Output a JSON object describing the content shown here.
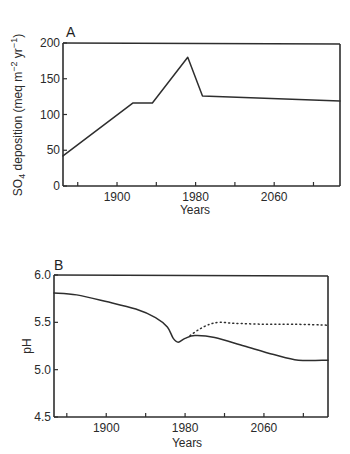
{
  "chart_data": [
    {
      "panel": "A",
      "type": "line",
      "title": "",
      "xlabel": "Years",
      "ylabel": "SO4 deposition (meq m-2 yr-1)",
      "ylabel_parts": {
        "main": "SO",
        "sub": "4",
        "rest": " deposition (meq m",
        "sup1": "−2",
        "mid": " yr",
        "sup2": "−1",
        "end": ")"
      },
      "xlim": [
        1845,
        2127
      ],
      "ylim": [
        0,
        200
      ],
      "x_tick_labels": [
        "1900",
        "1980",
        "2060"
      ],
      "x_ticks": [
        1860,
        1900,
        1940,
        1980,
        2020,
        2060,
        2100
      ],
      "y_tick_labels": [
        "0",
        "50",
        "100",
        "150",
        "200"
      ],
      "y_ticks": [
        0,
        50,
        100,
        150,
        200
      ],
      "grid": false,
      "series": [
        {
          "name": "SO4 deposition",
          "style": "solid",
          "x": [
            1845,
            1916,
            1936,
            1972,
            1987,
            2127
          ],
          "values": [
            42,
            116,
            116,
            180,
            126,
            119
          ]
        }
      ]
    },
    {
      "panel": "B",
      "type": "line",
      "title": "",
      "xlabel": "Years",
      "ylabel": "pH",
      "xlim": [
        1847,
        2125
      ],
      "ylim": [
        4.5,
        6.0
      ],
      "x_tick_labels": [
        "1900",
        "1980",
        "2060"
      ],
      "x_ticks": [
        1860,
        1900,
        1940,
        1980,
        2020,
        2060,
        2100
      ],
      "y_tick_labels": [
        "4.5",
        "5.0",
        "5.5",
        "6.0"
      ],
      "y_ticks": [
        4.5,
        5.0,
        5.5,
        6.0
      ],
      "grid": false,
      "series": [
        {
          "name": "pH (solid)",
          "style": "solid",
          "x": [
            1847,
            1870,
            1900,
            1930,
            1950,
            1962,
            1968,
            1973,
            1980,
            1990,
            2010,
            2040,
            2070,
            2095,
            2125
          ],
          "values": [
            5.81,
            5.79,
            5.72,
            5.64,
            5.55,
            5.45,
            5.33,
            5.29,
            5.33,
            5.36,
            5.34,
            5.25,
            5.16,
            5.1,
            5.1
          ]
        },
        {
          "name": "pH (dotted)",
          "style": "dotted",
          "x": [
            1985,
            1995,
            2005,
            2015,
            2030,
            2060,
            2090,
            2125
          ],
          "values": [
            5.36,
            5.43,
            5.48,
            5.5,
            5.49,
            5.48,
            5.48,
            5.47
          ]
        }
      ]
    }
  ]
}
